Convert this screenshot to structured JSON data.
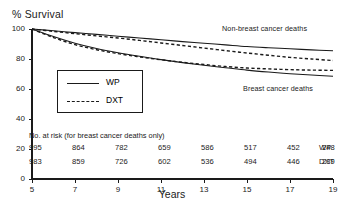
{
  "chart_data": {
    "type": "line",
    "title": "",
    "ylabel": "% Survival",
    "xlabel": "Years",
    "ylim": [
      0,
      100
    ],
    "xlim": [
      5,
      19
    ],
    "yticks": [
      0,
      20,
      40,
      60,
      80,
      100
    ],
    "xticks": [
      5,
      7,
      9,
      11,
      13,
      15,
      17,
      19
    ],
    "grid": false,
    "legend_position": "center-left inside plot",
    "legend": [
      {
        "label": "WP",
        "style": "solid"
      },
      {
        "label": "DXT",
        "style": "dashed"
      }
    ],
    "annotations": [
      {
        "text": "Non-breast cancer deaths",
        "x": 16.0,
        "y": 91
      },
      {
        "text": "Breast cancer deaths",
        "x": 16.6,
        "y": 62
      }
    ],
    "x": [
      5,
      6,
      7,
      8,
      9,
      10,
      11,
      12,
      13,
      14,
      15,
      16,
      17,
      18,
      19
    ],
    "series": [
      {
        "name": "Non-breast cancer deaths WP",
        "style": "solid",
        "values": [
          100,
          98.8,
          97.6,
          96.4,
          95.2,
          94.0,
          92.8,
          91.6,
          90.5,
          89.4,
          88.3,
          87.5,
          86.8,
          86.1,
          85.5
        ]
      },
      {
        "name": "Non-breast cancer deaths DXT",
        "style": "dashed",
        "values": [
          100,
          98.4,
          96.9,
          95.4,
          94.0,
          92.4,
          90.7,
          89.0,
          87.3,
          85.6,
          84.0,
          82.5,
          81.1,
          80.0,
          79.0
        ]
      },
      {
        "name": "Breast cancer deaths WP",
        "style": "solid",
        "values": [
          100,
          95.0,
          90.5,
          87.0,
          84.2,
          81.8,
          79.6,
          77.6,
          75.8,
          74.2,
          72.6,
          71.3,
          70.2,
          69.3,
          68.5
        ]
      },
      {
        "name": "Breast cancer deaths DXT",
        "style": "dashed",
        "values": [
          100,
          94.3,
          89.6,
          86.2,
          83.6,
          81.4,
          79.5,
          77.8,
          76.3,
          75.0,
          74.0,
          73.4,
          72.9,
          72.6,
          72.4
        ]
      }
    ],
    "risk_table": {
      "title": "No. at risk (for breast cancer deaths only)",
      "columns": [
        5,
        7,
        9,
        11,
        13,
        15,
        17,
        19
      ],
      "rows": [
        {
          "label": "WP",
          "values": [
            995,
            864,
            782,
            659,
            586,
            517,
            452,
            248
          ]
        },
        {
          "label": "DXT",
          "values": [
            983,
            859,
            726,
            602,
            536,
            494,
            446,
            239
          ]
        }
      ]
    },
    "colors": {
      "line": "#1a1a1a",
      "axis": "#1a1a1a",
      "background": "#ffffff"
    }
  }
}
